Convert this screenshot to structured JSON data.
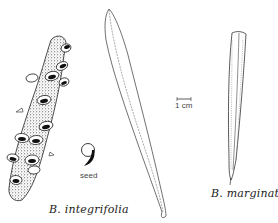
{
  "figure": {
    "labels": {
      "integrifolia": "B. integrifolia",
      "marginata": "B. marginata",
      "seed": "seed",
      "scale": "1 cm"
    },
    "colors": {
      "ink": "#222222",
      "background": "#ffffff"
    },
    "elements": [
      {
        "name": "cone",
        "species": "B. integrifolia"
      },
      {
        "name": "seed",
        "species": "B. integrifolia"
      },
      {
        "name": "leaf",
        "species": "B. integrifolia"
      },
      {
        "name": "leaf",
        "species": "B. marginata"
      },
      {
        "name": "scale-bar",
        "length": "1 cm"
      }
    ]
  }
}
